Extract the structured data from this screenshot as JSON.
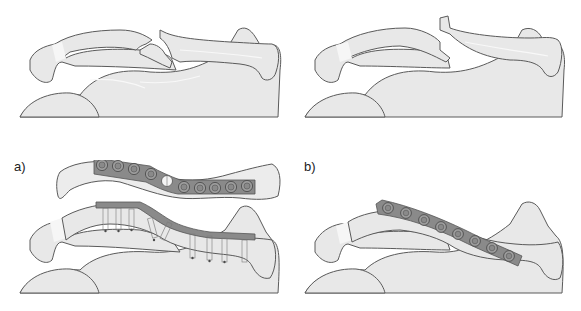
{
  "figure": {
    "panels": [
      {
        "id": "top-left",
        "content": "Displaced comminuted clavicle fracture with butterfly fragment"
      },
      {
        "id": "top-right",
        "content": "Displaced transverse/oblique clavicle fracture"
      },
      {
        "id": "bottom-left",
        "label": "a)",
        "content": "Superior view of plate on clavicle with lag screw, and anterior view with screws through plate"
      },
      {
        "id": "bottom-right",
        "label": "b)",
        "content": "Anterior-inferior plate fixation of clavicle"
      }
    ],
    "labels": {
      "a": "a)",
      "b": "b)"
    },
    "plate_a_holes": 10,
    "plate_a_screws": 8,
    "plate_b_holes": 8,
    "colors": {
      "bone_fill": "#e8e8e8",
      "outline": "#5a5a5a",
      "plate": "#8a8a8a",
      "background": "#ffffff"
    }
  }
}
